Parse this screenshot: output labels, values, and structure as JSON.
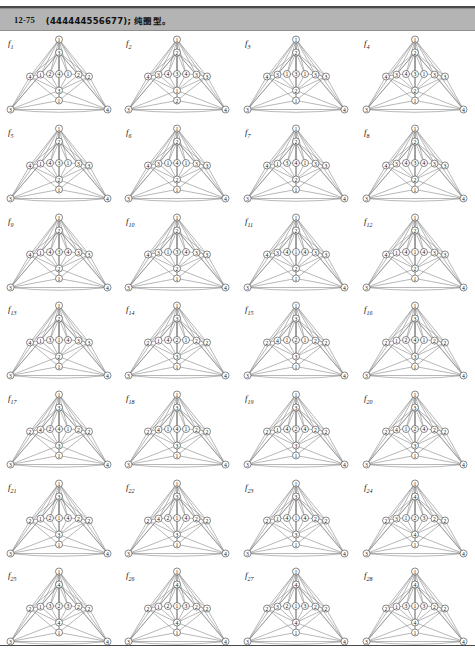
{
  "header": {
    "number": "12-75",
    "body": "(444444556677); 纯圈型。"
  },
  "figure_grid": {
    "rows": 7,
    "cols": 4,
    "count": 28
  },
  "graphs": [
    {
      "label": "f",
      "sub": "1",
      "apex": "1",
      "upper": "3",
      "middle": [
        "4",
        "1",
        "2",
        "4",
        "1",
        "2"
      ],
      "lower": "3",
      "base_center": "1",
      "left": "3",
      "right": "4"
    },
    {
      "label": "f",
      "sub": "2",
      "apex": "1",
      "upper": "2",
      "middle": [
        "4",
        "3",
        "4",
        "3",
        "4",
        "3"
      ],
      "lower": "1",
      "base_center": "2",
      "left": "3",
      "right": "4"
    },
    {
      "label": "f",
      "sub": "3",
      "apex": "1",
      "upper": "2",
      "middle": [
        "4",
        "3",
        "1",
        "3",
        "1",
        "3"
      ],
      "lower": "2",
      "base_center": "1",
      "left": "3",
      "right": "4"
    },
    {
      "label": "f",
      "sub": "4",
      "apex": "1",
      "upper": "2",
      "middle": [
        "4",
        "3",
        "4",
        "3",
        "1",
        "3"
      ],
      "lower": "2",
      "base_center": "1",
      "left": "3",
      "right": "4"
    },
    {
      "label": "f",
      "sub": "5",
      "apex": "1",
      "upper": "2",
      "middle": [
        "4",
        "1",
        "4",
        "3",
        "1",
        "3"
      ],
      "lower": "2",
      "base_center": "1",
      "left": "3",
      "right": "4"
    },
    {
      "label": "f",
      "sub": "6",
      "apex": "1",
      "upper": "2",
      "middle": [
        "4",
        "3",
        "1",
        "4",
        "1",
        "3"
      ],
      "lower": "2",
      "base_center": "1",
      "left": "3",
      "right": "4"
    },
    {
      "label": "f",
      "sub": "7",
      "apex": "1",
      "upper": "2",
      "middle": [
        "4",
        "1",
        "3",
        "4",
        "1",
        "3"
      ],
      "lower": "2",
      "base_center": "1",
      "left": "3",
      "right": "4"
    },
    {
      "label": "f",
      "sub": "8",
      "apex": "1",
      "upper": "2",
      "middle": [
        "4",
        "3",
        "4",
        "3",
        "4",
        "3"
      ],
      "lower": "2",
      "base_center": "1",
      "left": "3",
      "right": "4"
    },
    {
      "label": "f",
      "sub": "9",
      "apex": "1",
      "upper": "2",
      "middle": [
        "4",
        "1",
        "4",
        "3",
        "4",
        "3"
      ],
      "lower": "2",
      "base_center": "1",
      "left": "3",
      "right": "4"
    },
    {
      "label": "f",
      "sub": "10",
      "apex": "1",
      "upper": "2",
      "middle": [
        "4",
        "3",
        "1",
        "3",
        "4",
        "3"
      ],
      "lower": "2",
      "base_center": "1",
      "left": "3",
      "right": "4"
    },
    {
      "label": "f",
      "sub": "11",
      "apex": "1",
      "upper": "2",
      "middle": [
        "4",
        "3",
        "4",
        "1",
        "4",
        "3"
      ],
      "lower": "2",
      "base_center": "1",
      "left": "3",
      "right": "4"
    },
    {
      "label": "f",
      "sub": "12",
      "apex": "1",
      "upper": "2",
      "middle": [
        "4",
        "1",
        "4",
        "1",
        "4",
        "3"
      ],
      "lower": "2",
      "base_center": "1",
      "left": "3",
      "right": "4"
    },
    {
      "label": "f",
      "sub": "13",
      "apex": "1",
      "upper": "2",
      "middle": [
        "4",
        "1",
        "3",
        "1",
        "4",
        "3"
      ],
      "lower": "2",
      "base_center": "1",
      "left": "3",
      "right": "4"
    },
    {
      "label": "f",
      "sub": "14",
      "apex": "1",
      "upper": "3",
      "middle": [
        "2",
        "1",
        "4",
        "2",
        "1",
        "2"
      ],
      "lower": "3",
      "base_center": "1",
      "left": "3",
      "right": "4"
    },
    {
      "label": "f",
      "sub": "15",
      "apex": "1",
      "upper": "3",
      "middle": [
        "2",
        "4",
        "1",
        "2",
        "1",
        "2"
      ],
      "lower": "3",
      "base_center": "1",
      "left": "3",
      "right": "4"
    },
    {
      "label": "f",
      "sub": "16",
      "apex": "1",
      "upper": "3",
      "middle": [
        "2",
        "1",
        "2",
        "4",
        "1",
        "2"
      ],
      "lower": "3",
      "base_center": "1",
      "left": "3",
      "right": "4"
    },
    {
      "label": "f",
      "sub": "17",
      "apex": "1",
      "upper": "3",
      "middle": [
        "2",
        "4",
        "2",
        "4",
        "1",
        "2"
      ],
      "lower": "3",
      "base_center": "1",
      "left": "3",
      "right": "4"
    },
    {
      "label": "f",
      "sub": "18",
      "apex": "1",
      "upper": "3",
      "middle": [
        "2",
        "4",
        "1",
        "4",
        "1",
        "2"
      ],
      "lower": "3",
      "base_center": "1",
      "left": "3",
      "right": "4"
    },
    {
      "label": "f",
      "sub": "19",
      "apex": "1",
      "upper": "3",
      "middle": [
        "2",
        "1",
        "4",
        "2",
        "4",
        "2"
      ],
      "lower": "3",
      "base_center": "1",
      "left": "3",
      "right": "4"
    },
    {
      "label": "f",
      "sub": "20",
      "apex": "1",
      "upper": "3",
      "middle": [
        "2",
        "4",
        "1",
        "2",
        "4",
        "2"
      ],
      "lower": "3",
      "base_center": "1",
      "left": "3",
      "right": "4"
    },
    {
      "label": "f",
      "sub": "21",
      "apex": "1",
      "upper": "3",
      "middle": [
        "2",
        "1",
        "2",
        "1",
        "4",
        "2"
      ],
      "lower": "3",
      "base_center": "1",
      "left": "3",
      "right": "4"
    },
    {
      "label": "f",
      "sub": "22",
      "apex": "1",
      "upper": "3",
      "middle": [
        "2",
        "4",
        "2",
        "1",
        "4",
        "2"
      ],
      "lower": "3",
      "base_center": "1",
      "left": "3",
      "right": "4"
    },
    {
      "label": "f",
      "sub": "23",
      "apex": "1",
      "upper": "3",
      "middle": [
        "2",
        "1",
        "4",
        "1",
        "4",
        "2"
      ],
      "lower": "3",
      "base_center": "1",
      "left": "3",
      "right": "4"
    },
    {
      "label": "f",
      "sub": "24",
      "apex": "1",
      "upper": "4",
      "middle": [
        "2",
        "3",
        "1",
        "2",
        "3",
        "2"
      ],
      "lower": "4",
      "base_center": "1",
      "left": "3",
      "right": "4"
    },
    {
      "label": "f",
      "sub": "25",
      "apex": "1",
      "upper": "4",
      "middle": [
        "2",
        "1",
        "3",
        "2",
        "3",
        "2"
      ],
      "lower": "4",
      "base_center": "1",
      "left": "3",
      "right": "4"
    },
    {
      "label": "f",
      "sub": "26",
      "apex": "1",
      "upper": "4",
      "middle": [
        "2",
        "1",
        "2",
        "1",
        "3",
        "2"
      ],
      "lower": "4",
      "base_center": "1",
      "left": "3",
      "right": "4"
    },
    {
      "label": "f",
      "sub": "27",
      "apex": "1",
      "upper": "4",
      "middle": [
        "2",
        "3",
        "2",
        "1",
        "3",
        "2"
      ],
      "lower": "4",
      "base_center": "1",
      "left": "3",
      "right": "4"
    },
    {
      "label": "f",
      "sub": "28",
      "apex": "1",
      "upper": "4",
      "middle": [
        "2",
        "1",
        "3",
        "1",
        "3",
        "2"
      ],
      "lower": "4",
      "base_center": "1",
      "left": "3",
      "right": "4"
    }
  ]
}
